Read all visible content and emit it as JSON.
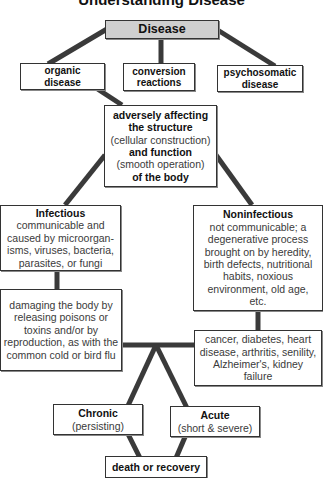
{
  "title": "Understanding Disease",
  "nodes": {
    "disease": {
      "label": "Disease"
    },
    "organic": {
      "label": "organic disease"
    },
    "conversion": {
      "label": "conversion reactions"
    },
    "psychosomatic": {
      "label": "psychosomatic disease"
    },
    "adversely": {
      "line1": "adversely affecting",
      "line2": "the structure",
      "line3": "(cellular construction)",
      "line4": "and function",
      "line5": "(smooth operation)",
      "line6": "of the body"
    },
    "infectious": {
      "heading": "Infectious",
      "desc": "communicable and caused by microorgan-isms, viruses, bacteria, parasites, or fungi"
    },
    "noninfectious": {
      "heading": "Noninfectious",
      "desc": "not communicable; a degenerative process brought on by heredity, birth defects, nutritional habits, noxious environment, old age, etc."
    },
    "damaging": {
      "desc": "damaging the body by releasing poisons or toxins and/or by reproduction, as with the common cold or bird flu"
    },
    "examples": {
      "desc": "cancer, diabetes, heart disease, arthritis, senility, Alzheimer's, kidney failure"
    },
    "chronic": {
      "heading": "Chronic",
      "desc": "(persisting)"
    },
    "acute": {
      "heading": "Acute",
      "desc": "(short & severe)"
    },
    "outcome": {
      "label": "death or recovery"
    }
  },
  "colors": {
    "connector": "#3a3a3a",
    "root_fill": "#cfcfcf",
    "border": "#333333"
  }
}
